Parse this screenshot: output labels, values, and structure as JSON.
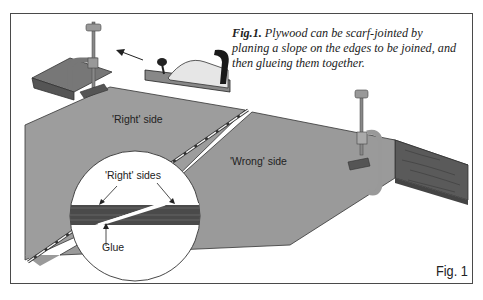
{
  "caption": {
    "fig_label": "Fig.1.",
    "text": "Plywood can be scarf-jointed by planing a slope on the edges to be joined, and then glueing them together."
  },
  "labels": {
    "right_side": "'Right' side",
    "wrong_side": "'Wrong' side",
    "right_sides": "'Right' sides",
    "glue": "Glue"
  },
  "figure_number": "Fig. 1",
  "colors": {
    "panel": "#9a9a9a",
    "wood": "#5a5a5a",
    "outline": "#333333",
    "frame": "#4a4a4a"
  }
}
